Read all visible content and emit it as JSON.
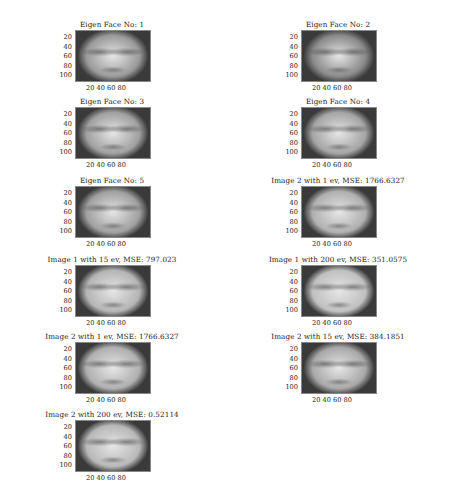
{
  "figure": {
    "yticks": [
      "20",
      "40",
      "60",
      "80",
      "100"
    ],
    "xticks": "20 40 60 80",
    "panels": [
      {
        "title": "Eigen Face No: 1",
        "content": "eigenface-1",
        "tone": "#9a9a9a"
      },
      {
        "title": "Eigen Face No: 2",
        "content": "eigenface-2",
        "tone": "#8a8a8a"
      },
      {
        "title": "Eigen Face No: 3",
        "content": "eigenface-3",
        "tone": "#a0a0a0"
      },
      {
        "title": "Eigen Face No: 4",
        "content": "eigenface-4",
        "tone": "#a5a5a5"
      },
      {
        "title": "Eigen Face No: 5",
        "content": "eigenface-5",
        "tone": "#a0a0a0"
      },
      {
        "title": "Image 2 with 1 ev, MSE: 1766.6327",
        "content": "reconstruction",
        "tone": "#b0b0b0"
      },
      {
        "title": "Image 1 with 15 ev, MSE: 797.023",
        "content": "reconstruction",
        "tone": "#b5b5b5"
      },
      {
        "title": "Image 1 with 200 ev, MSE: 351.0575",
        "content": "reconstruction",
        "tone": "#c0c0c0"
      },
      {
        "title": "Image 2 with 1 ev, MSE: 1766.6327",
        "content": "reconstruction",
        "tone": "#b0b0b0"
      },
      {
        "title": "Image 2 with 15 ev, MSE: 384.1851",
        "content": "reconstruction",
        "tone": "#a8a8a8"
      },
      {
        "title": "Image 2 with 200 ev, MSE: 0.52114",
        "content": "reconstruction",
        "tone": "#b8b8b8"
      }
    ]
  }
}
